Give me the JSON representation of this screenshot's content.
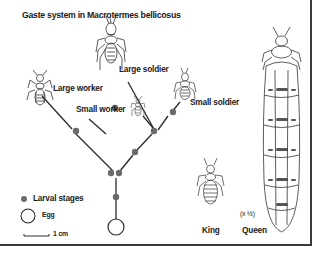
{
  "title": "Gaste system in Macrotermes bellicosus",
  "castes": {
    "large_worker": "Large worker",
    "large_soldier": "Large soldier",
    "small_worker": "Small worker",
    "small_soldier": "Small soldier",
    "king": "King",
    "queen": "Queen"
  },
  "legend": {
    "larval_stages": "Larval stages",
    "egg": "Egg",
    "scale": "1 cm",
    "queen_scale_note": "(x ½)"
  },
  "colors": {
    "line": "#2a2a2a",
    "node": "#6b6b6b",
    "frame": "#3a3a3a"
  }
}
